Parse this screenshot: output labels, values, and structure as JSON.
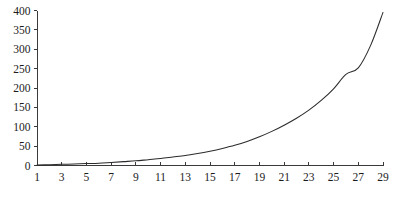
{
  "chart_data": {
    "type": "line",
    "title": "",
    "subtitle": "",
    "xlabel": "",
    "ylabel": "",
    "xlim": [
      1,
      29
    ],
    "ylim": [
      0,
      400
    ],
    "grid": false,
    "legend": null,
    "legend_position": "none",
    "series_color": "#2b2b2b",
    "axis_color": "#3a3a3a",
    "background": "#ffffff",
    "x_ticks": [
      1,
      3,
      5,
      7,
      9,
      11,
      13,
      15,
      17,
      19,
      21,
      23,
      25,
      27,
      29
    ],
    "x_tick_labels": [
      "1",
      "3",
      "5",
      "7",
      "9",
      "11",
      "13",
      "15",
      "17",
      "19",
      "21",
      "23",
      "25",
      "27",
      "29"
    ],
    "y_ticks": [
      0,
      50,
      100,
      150,
      200,
      250,
      300,
      350,
      400
    ],
    "y_tick_labels": [
      "0",
      "50",
      "100",
      "150",
      "200",
      "250",
      "300",
      "350",
      "400"
    ],
    "x": [
      1,
      2,
      3,
      4,
      5,
      6,
      7,
      8,
      9,
      10,
      11,
      12,
      13,
      14,
      15,
      16,
      17,
      18,
      19,
      20,
      21,
      22,
      23,
      24,
      25,
      26,
      27,
      28,
      29
    ],
    "values": [
      1,
      2,
      3,
      4,
      5,
      6,
      8,
      10,
      12,
      15,
      18,
      22,
      26,
      31,
      37,
      44,
      52,
      62,
      74,
      88,
      104,
      122,
      143,
      168,
      198,
      235,
      252,
      310,
      395
    ],
    "series": [
      {
        "name": "",
        "values": [
          1,
          2,
          3,
          4,
          5,
          6,
          8,
          10,
          12,
          15,
          18,
          22,
          26,
          31,
          37,
          44,
          52,
          62,
          74,
          88,
          104,
          122,
          143,
          168,
          198,
          235,
          252,
          310,
          395
        ]
      }
    ],
    "annotations": []
  }
}
